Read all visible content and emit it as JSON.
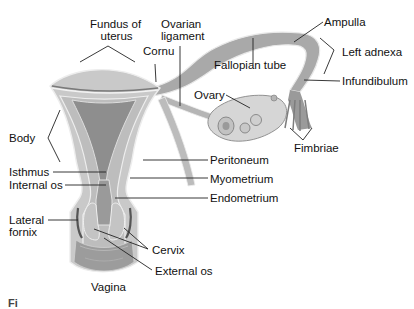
{
  "diagram": {
    "colors": {
      "background": "#ffffff",
      "outer_wall": "#c9c9c9",
      "myometrium": "#bdbdbd",
      "endometrium": "#8e8e8e",
      "serosa_line": "#f2f2f2",
      "tube": "#a9a9a9",
      "ovary": "#d6d6d6",
      "vagina": "#9c9c9c",
      "label_text": "#111111",
      "leader_line": "#222222"
    },
    "labels": {
      "fundus": "Fundus of uterus",
      "fundus_line1": "Fundus of",
      "fundus_line2": "uterus",
      "ovarian_ligament_line1": "Ovarian",
      "ovarian_ligament_line2": "ligament",
      "cornu": "Cornu",
      "ampulla": "Ampulla",
      "left_adnexa": "Left adnexa",
      "fallopian_tube": "Fallopian tube",
      "infundibulum": "Infundibulum",
      "ovary": "Ovary",
      "body": "Body",
      "fimbriae": "Fimbriae",
      "isthmus": "Isthmus",
      "peritoneum": "Peritoneum",
      "internal_os": "Internal os",
      "myometrium": "Myometrium",
      "endometrium": "Endometrium",
      "lateral_fornix_line1": "Lateral",
      "lateral_fornix_line2": "fornix",
      "cervix": "Cervix",
      "external_os": "External os",
      "vagina": "Vagina"
    },
    "caption_partial": "Fi"
  }
}
